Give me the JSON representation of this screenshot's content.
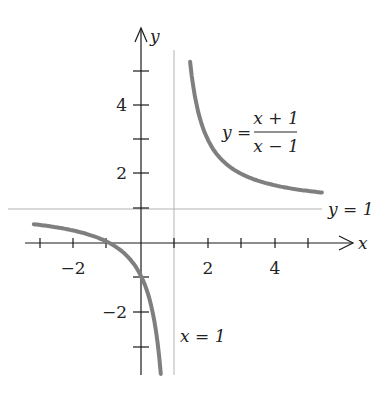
{
  "chart_data": {
    "type": "line",
    "title": "",
    "function": "y = (x + 1)/(x - 1)",
    "xlabel": "x",
    "ylabel": "y",
    "xlim": [
      -3,
      5.5
    ],
    "ylim": [
      -3.9,
      5.3
    ],
    "x_ticks": [
      -3,
      -2,
      -1,
      1,
      2,
      3,
      4,
      5
    ],
    "x_tick_labels": [
      "-2",
      "2",
      "4"
    ],
    "y_ticks": [
      -3,
      -2,
      -1,
      1,
      2,
      3,
      4,
      5
    ],
    "y_tick_labels": [
      "-2",
      "2",
      "4"
    ],
    "series": [
      {
        "name": "left branch",
        "x": [
          -3,
          -2,
          -1,
          0,
          0.3,
          0.5,
          0.59
        ],
        "y": [
          0.5,
          0.333,
          0,
          -1,
          -1.857,
          -3,
          -3.88
        ]
      },
      {
        "name": "right branch",
        "x": [
          1.465,
          1.6,
          2,
          2.5,
          3,
          4,
          5.4
        ],
        "y": [
          5.3,
          4.333,
          3,
          2.333,
          2,
          1.667,
          1.455
        ]
      }
    ],
    "asymptotes": [
      {
        "type": "vertical",
        "value": 1,
        "label": "x = 1"
      },
      {
        "type": "horizontal",
        "value": 1,
        "label": "y = 1"
      }
    ],
    "annotations": [
      "y = (x + 1)/(x - 1)",
      "x = 1",
      "y = 1"
    ],
    "grid": false,
    "legend": "none"
  },
  "labels": {
    "x_axis": "x",
    "y_axis": "y",
    "tick_x_neg2": "−2",
    "tick_x_2": "2",
    "tick_x_4": "4",
    "tick_y_4": "4",
    "tick_y_2": "2",
    "tick_y_neg2": "−2",
    "eq_lhs": "y =",
    "eq_num": "x + 1",
    "eq_den": "x − 1",
    "vasym": "x = 1",
    "hasym": "y = 1"
  },
  "colors": {
    "curve": "#7f7f7f",
    "axis": "#1a1a1a",
    "asymptote": "#b3b3b3"
  }
}
